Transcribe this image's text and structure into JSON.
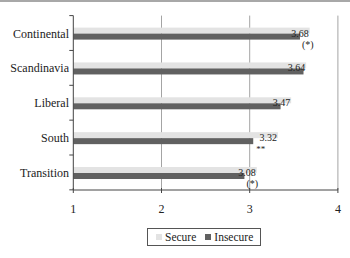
{
  "chart_data": {
    "type": "bar",
    "orientation": "horizontal",
    "title": "",
    "xlabel": "",
    "ylabel": "",
    "categories": [
      "Continental",
      "Scandinavia",
      "Liberal",
      "South",
      "Transition"
    ],
    "series": [
      {
        "name": "Secure",
        "color": "#e3e3e3",
        "values": [
          3.68,
          3.64,
          3.47,
          3.32,
          3.08
        ]
      },
      {
        "name": "Insecure",
        "color": "#616161",
        "values": [
          3.57,
          3.61,
          3.35,
          3.04,
          2.94
        ]
      }
    ],
    "data_labels": [
      "3.68",
      "3.64",
      "3.47",
      "3.32",
      "3.08"
    ],
    "annotations": [
      "(*)",
      "",
      "",
      "**",
      "(*)"
    ],
    "xlim": [
      1,
      4
    ],
    "xticks": [
      1,
      2,
      3,
      4
    ],
    "xtick_labels": [
      "1",
      "2",
      "3",
      "4"
    ],
    "grid": {
      "vertical": true,
      "horizontal": false
    },
    "legend_position": "bottom"
  },
  "legend": {
    "items": [
      {
        "label": "Secure",
        "color": "#e3e3e3"
      },
      {
        "label": "Insecure",
        "color": "#616161"
      }
    ]
  }
}
